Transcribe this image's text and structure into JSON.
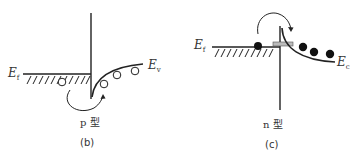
{
  "figure": {
    "panels": [
      {
        "id": "b",
        "caption": "(b)",
        "type_label": "p 型",
        "left_level_label": "E",
        "left_level_sub": "f",
        "right_band_label": "E",
        "right_band_sub": "v",
        "carriers": "holes (open circles)",
        "hole_count_right": 3,
        "hole_count_left": 1
      },
      {
        "id": "c",
        "caption": "(c)",
        "type_label": "n 型",
        "left_level_label": "E",
        "left_level_sub": "f",
        "right_band_label": "E",
        "right_band_sub": "c",
        "carriers": "electrons (filled circles)",
        "electron_count_right": 3,
        "electron_count_left": 1
      }
    ],
    "colors": {
      "line": "#222222",
      "text": "#333333",
      "metal_stub": "#bbbbbb"
    }
  }
}
